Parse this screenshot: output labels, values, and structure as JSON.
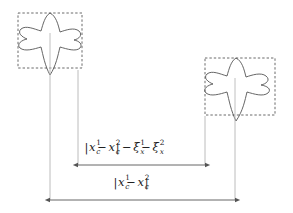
{
  "figure": {
    "background_color": "#ffffff",
    "stroke_color": "#555555",
    "dashed_box_color": "#444444",
    "leader_line_color": "#b4b4b4",
    "arrow_color": "#555555",
    "text_color": "#1a1a1a"
  },
  "shapes": [
    {
      "name": "star-shape-1",
      "label": "object 1",
      "box": {
        "x": 18,
        "y": 13,
        "width": 64,
        "height": 55
      },
      "center": {
        "x": 50,
        "y": 43
      }
    },
    {
      "name": "star-shape-2",
      "label": "object 2",
      "box": {
        "x": 205,
        "y": 58,
        "width": 70,
        "height": 57
      },
      "center": {
        "x": 236,
        "y": 89
      }
    }
  ],
  "dimensions": [
    {
      "name": "gap-dimension",
      "formula_parts": {
        "abs_open": "|",
        "var": "x",
        "sub": "c",
        "sup1": "1",
        "minus": "−",
        "sup2": "2",
        "abs_close": "|",
        "xi": "ξ",
        "xi_sub": "x",
        "xi_sup1": "1",
        "xi_sup2": "2"
      },
      "formula_text": "|x¹ᶜ − x²ᶜ| − ξ¹ₓ − ξ²ₓ",
      "arrow": {
        "x1": 78,
        "x2": 205,
        "y": 165
      }
    },
    {
      "name": "total-dimension",
      "formula_text": "|x¹ᶜ − x²ᶜ|",
      "arrow": {
        "x1": 50,
        "x2": 235,
        "y": 200
      }
    }
  ],
  "leader_lines": [
    {
      "name": "leader-left-center",
      "x": 50,
      "y1": 70,
      "y2": 200
    },
    {
      "name": "leader-left-box-right",
      "x": 78,
      "y1": 72,
      "y2": 165
    },
    {
      "name": "leader-right-box-left",
      "x": 205,
      "y1": 118,
      "y2": 165
    },
    {
      "name": "leader-right-center",
      "x": 235,
      "y1": 118,
      "y2": 200
    }
  ]
}
